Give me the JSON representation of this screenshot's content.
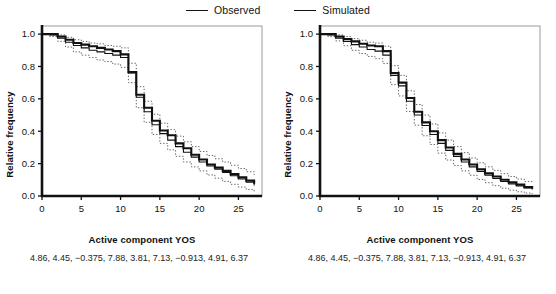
{
  "legend": {
    "items": [
      {
        "label": "Observed",
        "style": "solid",
        "color": "#111111"
      },
      {
        "label": "Simulated",
        "style": "solid",
        "color": "#111111"
      }
    ]
  },
  "panels": [
    {
      "id": "left",
      "ylabel": "Relative frequency",
      "xlabel": "Active component YOS",
      "caption": "4.86, 4.45, −0.375, 7.88, 3.81, 7.13, −0.913, 4.91, 6.37"
    },
    {
      "id": "right",
      "ylabel": "Relative frequency",
      "xlabel": "Active component YOS",
      "caption": "4.86, 4.45, −0.375, 7.88, 3.81, 7.13, −0.913, 4.91, 6.37"
    }
  ],
  "chart_data": [
    {
      "type": "line",
      "panel": "left",
      "title": "",
      "xlabel": "Active component YOS",
      "ylabel": "Relative frequency",
      "xlim": [
        0,
        28
      ],
      "ylim": [
        0,
        1.05
      ],
      "xticks": [
        0,
        5,
        10,
        15,
        20,
        25
      ],
      "yticks": [
        0.0,
        0.2,
        0.4,
        0.6,
        0.8,
        1.0
      ],
      "grid": false,
      "legend_position": "top-center",
      "step": true,
      "series": [
        {
          "name": "Observed",
          "x": [
            0,
            1,
            2,
            3,
            4,
            5,
            6,
            7,
            8,
            9,
            10,
            11,
            12,
            13,
            14,
            15,
            16,
            17,
            18,
            19,
            20,
            21,
            22,
            23,
            24,
            25,
            26,
            27
          ],
          "values": [
            1.0,
            1.0,
            0.985,
            0.965,
            0.945,
            0.935,
            0.925,
            0.915,
            0.905,
            0.895,
            0.875,
            0.765,
            0.625,
            0.545,
            0.465,
            0.405,
            0.375,
            0.325,
            0.295,
            0.255,
            0.225,
            0.195,
            0.175,
            0.155,
            0.135,
            0.115,
            0.095,
            0.075
          ]
        },
        {
          "name": "Simulated",
          "x": [
            0,
            1,
            2,
            3,
            4,
            5,
            6,
            7,
            8,
            9,
            10,
            11,
            12,
            13,
            14,
            15,
            16,
            17,
            18,
            19,
            20,
            21,
            22,
            23,
            24,
            25,
            26,
            27
          ],
          "values": [
            1.0,
            0.995,
            0.975,
            0.95,
            0.93,
            0.915,
            0.9,
            0.89,
            0.88,
            0.87,
            0.855,
            0.76,
            0.61,
            0.52,
            0.44,
            0.385,
            0.345,
            0.305,
            0.27,
            0.24,
            0.21,
            0.185,
            0.165,
            0.145,
            0.125,
            0.105,
            0.085,
            0.065
          ]
        },
        {
          "name": "Simulated upper CI",
          "x": [
            0,
            1,
            2,
            3,
            4,
            5,
            6,
            7,
            8,
            9,
            10,
            11,
            12,
            13,
            14,
            15,
            16,
            17,
            18,
            19,
            20,
            21,
            22,
            23,
            24,
            25,
            26,
            27
          ],
          "values": [
            1.0,
            1.0,
            0.995,
            0.98,
            0.965,
            0.955,
            0.945,
            0.94,
            0.93,
            0.925,
            0.915,
            0.82,
            0.675,
            0.585,
            0.505,
            0.45,
            0.41,
            0.37,
            0.335,
            0.305,
            0.275,
            0.25,
            0.23,
            0.21,
            0.19,
            0.17,
            0.15,
            0.13
          ],
          "style": "dotted"
        },
        {
          "name": "Simulated lower CI",
          "x": [
            0,
            1,
            2,
            3,
            4,
            5,
            6,
            7,
            8,
            9,
            10,
            11,
            12,
            13,
            14,
            15,
            16,
            17,
            18,
            19,
            20,
            21,
            22,
            23,
            24,
            25,
            26,
            27
          ],
          "values": [
            1.0,
            0.985,
            0.955,
            0.92,
            0.89,
            0.87,
            0.855,
            0.84,
            0.83,
            0.815,
            0.795,
            0.7,
            0.545,
            0.455,
            0.38,
            0.325,
            0.285,
            0.245,
            0.21,
            0.18,
            0.155,
            0.13,
            0.11,
            0.09,
            0.072,
            0.055,
            0.04,
            0.028
          ],
          "style": "dotted"
        }
      ]
    },
    {
      "type": "line",
      "panel": "right",
      "title": "",
      "xlabel": "Active component YOS",
      "ylabel": "Relative frequency",
      "xlim": [
        0,
        28
      ],
      "ylim": [
        0,
        1.05
      ],
      "xticks": [
        0,
        5,
        10,
        15,
        20,
        25
      ],
      "yticks": [
        0.0,
        0.2,
        0.4,
        0.6,
        0.8,
        1.0
      ],
      "grid": false,
      "legend_position": "top-center",
      "step": true,
      "series": [
        {
          "name": "Observed",
          "x": [
            0,
            1,
            2,
            3,
            4,
            5,
            6,
            7,
            8,
            9,
            10,
            11,
            12,
            13,
            14,
            15,
            16,
            17,
            18,
            19,
            20,
            21,
            22,
            23,
            24,
            25,
            26,
            27
          ],
          "values": [
            1.0,
            1.0,
            0.985,
            0.97,
            0.955,
            0.94,
            0.93,
            0.925,
            0.895,
            0.76,
            0.7,
            0.605,
            0.52,
            0.455,
            0.4,
            0.345,
            0.3,
            0.26,
            0.225,
            0.195,
            0.165,
            0.14,
            0.12,
            0.1,
            0.085,
            0.07,
            0.055,
            0.045
          ]
        },
        {
          "name": "Simulated",
          "x": [
            0,
            1,
            2,
            3,
            4,
            5,
            6,
            7,
            8,
            9,
            10,
            11,
            12,
            13,
            14,
            15,
            16,
            17,
            18,
            19,
            20,
            21,
            22,
            23,
            24,
            25,
            26,
            27
          ],
          "values": [
            1.0,
            0.995,
            0.975,
            0.955,
            0.935,
            0.92,
            0.905,
            0.895,
            0.87,
            0.745,
            0.68,
            0.585,
            0.5,
            0.435,
            0.38,
            0.325,
            0.282,
            0.245,
            0.21,
            0.18,
            0.152,
            0.128,
            0.108,
            0.09,
            0.075,
            0.062,
            0.05,
            0.04
          ]
        },
        {
          "name": "Simulated upper CI",
          "x": [
            0,
            1,
            2,
            3,
            4,
            5,
            6,
            7,
            8,
            9,
            10,
            11,
            12,
            13,
            14,
            15,
            16,
            17,
            18,
            19,
            20,
            21,
            22,
            23,
            24,
            25,
            26,
            27
          ],
          "values": [
            1.0,
            1.0,
            0.995,
            0.985,
            0.972,
            0.962,
            0.95,
            0.945,
            0.925,
            0.805,
            0.745,
            0.65,
            0.565,
            0.5,
            0.445,
            0.39,
            0.345,
            0.305,
            0.268,
            0.235,
            0.205,
            0.18,
            0.158,
            0.138,
            0.12,
            0.105,
            0.09,
            0.078
          ],
          "style": "dotted"
        },
        {
          "name": "Simulated lower CI",
          "x": [
            0,
            1,
            2,
            3,
            4,
            5,
            6,
            7,
            8,
            9,
            10,
            11,
            12,
            13,
            14,
            15,
            16,
            17,
            18,
            19,
            20,
            21,
            22,
            23,
            24,
            25,
            26,
            27
          ],
          "values": [
            1.0,
            0.985,
            0.958,
            0.928,
            0.9,
            0.88,
            0.862,
            0.848,
            0.818,
            0.688,
            0.618,
            0.522,
            0.438,
            0.372,
            0.318,
            0.265,
            0.222,
            0.188,
            0.155,
            0.128,
            0.102,
            0.082,
            0.064,
            0.048,
            0.036,
            0.026,
            0.018,
            0.012
          ],
          "style": "dotted"
        }
      ]
    }
  ]
}
